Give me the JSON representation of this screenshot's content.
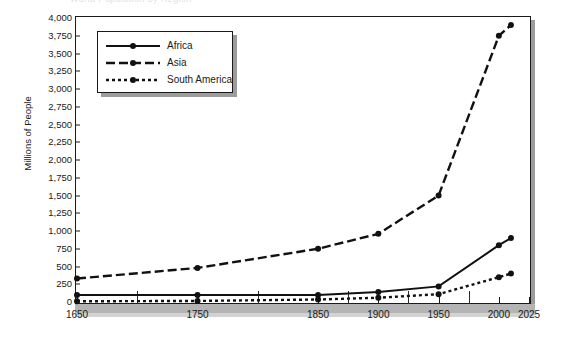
{
  "top_cut_text": "World Population by Region",
  "chart_data": {
    "type": "line",
    "title": "",
    "xlabel": "",
    "ylabel": "Millions of People",
    "xlim": [
      1650,
      2025
    ],
    "ylim": [
      0,
      4000
    ],
    "ytick_step": 250,
    "grid": false,
    "legend_position": "top-left",
    "x_ticks": [
      {
        "label": "1650",
        "value": 1650
      },
      {
        "label": "1750",
        "value": 1750
      },
      {
        "label": "1850",
        "value": 1850
      },
      {
        "label": "1900",
        "value": 1900
      },
      {
        "label": "1950",
        "value": 1950
      },
      {
        "label": "2000",
        "value": 2000
      },
      {
        "label": "2025",
        "value": 2025
      }
    ],
    "y_ticks": [
      {
        "label": "4,000",
        "value": 4000
      },
      {
        "label": "3,750",
        "value": 3750
      },
      {
        "label": "3,500",
        "value": 3500
      },
      {
        "label": "3,250",
        "value": 3250
      },
      {
        "label": "3,000",
        "value": 3000
      },
      {
        "label": "2,750",
        "value": 2750
      },
      {
        "label": "2,500",
        "value": 2500
      },
      {
        "label": "2,250",
        "value": 2250
      },
      {
        "label": "2,000",
        "value": 2000
      },
      {
        "label": "1,750",
        "value": 1750
      },
      {
        "label": "1,500",
        "value": 1500
      },
      {
        "label": "1,250",
        "value": 1250
      },
      {
        "label": "1,000",
        "value": 1000
      },
      {
        "label": "750",
        "value": 750
      },
      {
        "label": "500",
        "value": 500
      },
      {
        "label": "250",
        "value": 250
      },
      {
        "label": "0",
        "value": 0
      }
    ],
    "x": [
      1650,
      1750,
      1850,
      1900,
      1950,
      2000,
      2010
    ],
    "series": [
      {
        "name": "Africa",
        "style": "solid",
        "color": "#111111",
        "values": [
          100,
          100,
          100,
          140,
          220,
          800,
          900
        ]
      },
      {
        "name": "Asia",
        "style": "dashed",
        "color": "#111111",
        "values": [
          330,
          480,
          750,
          960,
          1500,
          3750,
          3900
        ]
      },
      {
        "name": "South America",
        "style": "dotted",
        "color": "#111111",
        "values": [
          10,
          15,
          35,
          60,
          110,
          350,
          400
        ]
      }
    ]
  },
  "legend": {
    "items": [
      {
        "label": "Africa",
        "style": "solid"
      },
      {
        "label": "Asia",
        "style": "dashed"
      },
      {
        "label": "South America",
        "style": "dotted"
      }
    ]
  }
}
